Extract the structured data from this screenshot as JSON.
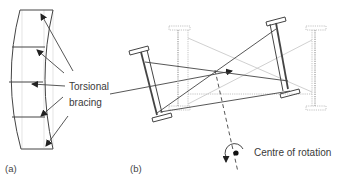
{
  "diagram": {
    "panel_a": {
      "caption": "(a)",
      "label_line1": "Torsional",
      "label_line2": "bracing"
    },
    "panel_b": {
      "caption": "(b)",
      "rotation_label": "Centre of rotation"
    },
    "colors": {
      "stroke": "#3a3a3a",
      "ghost": "#bdbdbd",
      "background": "#ffffff"
    }
  }
}
